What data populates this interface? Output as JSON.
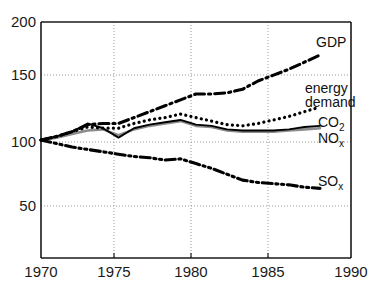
{
  "chart_data": {
    "type": "line",
    "title": "",
    "subtitle": "",
    "xlabel": "",
    "ylabel": "",
    "xlim": [
      1970,
      1990
    ],
    "ylim": [
      0,
      200
    ],
    "xticks": [
      1970,
      1975,
      1980,
      1985,
      1990
    ],
    "yticks": [
      50,
      100,
      150,
      200
    ],
    "xtick_labels": [
      "1970",
      "1975",
      "1980",
      "1985",
      "1990"
    ],
    "ytick_labels": [
      "50",
      "100",
      "150",
      "200"
    ],
    "grid": "dotted gridlines at y=50,100,150 and x=1975,1980,1985",
    "legend_position": "inline-right-of-curve-ends",
    "index_base": "1970 = 100",
    "x": [
      1970,
      1971,
      1972,
      1973,
      1974,
      1975,
      1976,
      1977,
      1978,
      1979,
      1980,
      1981,
      1982,
      1983,
      1984,
      1985,
      1986,
      1987,
      1988
    ],
    "series": [
      {
        "name": "GDP",
        "label": "GDP",
        "style": "dash-dot",
        "color": "#000000",
        "values": [
          100,
          103,
          107,
          113,
          114,
          114,
          119,
          124,
          129,
          134,
          139,
          139,
          140,
          143,
          150,
          155,
          160,
          166,
          172
        ]
      },
      {
        "name": "energy demand",
        "label_line1": "energy",
        "label_line2": "demand",
        "style": "dotted",
        "color": "#000000",
        "values": [
          100,
          103,
          107,
          111,
          110,
          110,
          114,
          117,
          119,
          122,
          119,
          116,
          113,
          112,
          114,
          117,
          120,
          124,
          128
        ]
      },
      {
        "name": "CO2",
        "label": "CO",
        "label_sub": "2",
        "style": "solid",
        "color": "#000000",
        "values": [
          100,
          103,
          107,
          114,
          110,
          102,
          110,
          113,
          115,
          117,
          113,
          112,
          109,
          108,
          108,
          108,
          109,
          111,
          112
        ]
      },
      {
        "name": "NOx",
        "label": "NO",
        "label_sub": "x",
        "style": "solid-thin-gray",
        "color": "#8c8c8c",
        "values": [
          100,
          102,
          105,
          108,
          109,
          104,
          109,
          112,
          114,
          116,
          112,
          111,
          108,
          107,
          107,
          107,
          108,
          109,
          110
        ]
      },
      {
        "name": "SOx",
        "label": "SO",
        "label_sub": "x",
        "style": "dash-dot-dot",
        "color": "#000000",
        "values": [
          100,
          97,
          94,
          92,
          90,
          88,
          86,
          85,
          83,
          84,
          80,
          76,
          71,
          66,
          64,
          63,
          62,
          60,
          59
        ]
      }
    ]
  },
  "axis": {
    "y_labels": [
      "200",
      "150",
      "100",
      "50"
    ],
    "x_labels": [
      "1970",
      "1975",
      "1980",
      "1985",
      "1990"
    ]
  },
  "labels": {
    "gdp": "GDP",
    "energy_line1": "energy",
    "energy_line2": "demand",
    "co2_main": "CO",
    "co2_sub": "2",
    "nox_main": "NO",
    "nox_sub": "x",
    "sox_main": "SO",
    "sox_sub": "x"
  },
  "colors": {
    "axis": "#1a1a1a",
    "grid": "#9a9a9a",
    "ink": "#000000",
    "nox_gray": "#8c8c8c",
    "background": "#ffffff"
  }
}
